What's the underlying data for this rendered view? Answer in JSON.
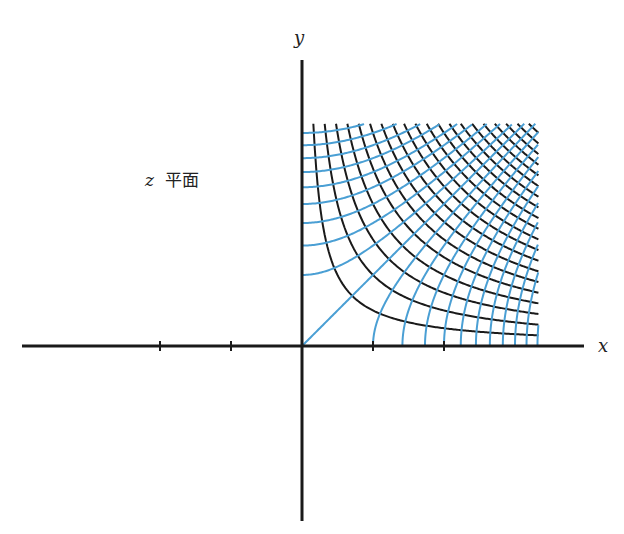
{
  "labels": {
    "y_axis": "y",
    "x_axis": "x",
    "plane_var": "z",
    "plane_text": "平面"
  },
  "colors": {
    "axis": "#1a1a1a",
    "black_curves": "#1a1a1a",
    "blue_curves": "#4a9fd4",
    "background": "#ffffff"
  },
  "chart_data": {
    "type": "line",
    "title": "z 平面",
    "xlabel": "x",
    "ylabel": "y",
    "origin_px": [
      302,
      346
    ],
    "unit_px": 71,
    "x_ticks": [
      -2,
      -1,
      1,
      2
    ],
    "xlim": [
      -3.94,
      3.97
    ],
    "ylim": [
      -2.46,
      4.03
    ],
    "grid_region": {
      "x": [
        0,
        3.33
      ],
      "y": [
        0,
        3.13
      ]
    },
    "series": [
      {
        "name": "xy = c",
        "color": "#1a1a1a",
        "c_start": 0.5,
        "c_step": 0.5,
        "c_end": 10.5
      },
      {
        "name": "x^2 - y^2 = c",
        "color": "#4a9fd4",
        "c_start": -9,
        "c_step": 1,
        "c_end": 11
      }
    ]
  }
}
